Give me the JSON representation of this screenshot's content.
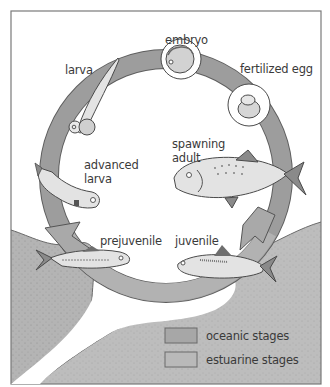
{
  "figure": {
    "colors": {
      "background": "#ffffff",
      "frame": "#7a7a7a",
      "ring": "#9b9b9b",
      "ring_outline": "#5e5e5e",
      "oceanic_fill": "#a7a7a7",
      "estuarine_fill": "#b9b9b9",
      "fish_body": "#e3e3e3",
      "fish_outline": "#4a4a4a",
      "label_text": "#3a3a3a"
    },
    "stages": [
      {
        "id": "embryo",
        "label": "embryo"
      },
      {
        "id": "fertilized-egg",
        "label": "fertilized egg"
      },
      {
        "id": "spawning-adult",
        "label_line1": "spawning",
        "label_line2": "adult"
      },
      {
        "id": "juvenile",
        "label": "juvenile"
      },
      {
        "id": "prejuvenile",
        "label": "prejuvenile"
      },
      {
        "id": "advanced-larva",
        "label_line1": "advanced",
        "label_line2": "larva"
      },
      {
        "id": "larva",
        "label": "larva"
      }
    ],
    "legend": {
      "items": [
        {
          "label": "oceanic stages",
          "color": "#a7a7a7"
        },
        {
          "label": "estuarine stages",
          "color": "#b9b9b9"
        }
      ]
    }
  }
}
